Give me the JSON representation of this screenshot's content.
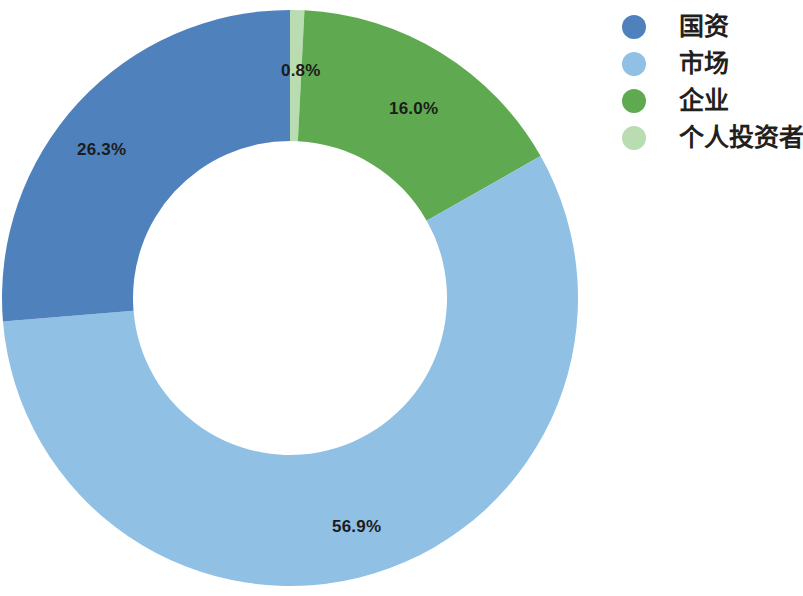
{
  "chart_data": {
    "type": "pie",
    "variant": "donut",
    "title": "",
    "subtitle": "",
    "xlabel": "",
    "ylabel": "",
    "grid": false,
    "legend_position": "right",
    "value_unit": "%",
    "start_angle_deg": 0,
    "direction": "clockwise",
    "categories": [
      "个人投资者",
      "企业",
      "市场",
      "国资"
    ],
    "values": [
      0.8,
      16.0,
      56.9,
      26.3
    ],
    "labels": [
      "0.8%",
      "16.0%",
      "56.9%",
      "26.3%"
    ],
    "colors": [
      "#b9ddb0",
      "#5faa50",
      "#90c0e4",
      "#4f82bd"
    ],
    "slices": [
      {
        "name": "个人投资者",
        "value": 0.8,
        "label": "0.8%",
        "color": "#b9ddb0"
      },
      {
        "name": "企业",
        "value": 16.0,
        "label": "16.0%",
        "color": "#5faa50"
      },
      {
        "name": "市场",
        "value": 56.9,
        "label": "56.9%",
        "color": "#90c0e4"
      },
      {
        "name": "国资",
        "value": 26.3,
        "label": "26.3%",
        "color": "#4f82bd"
      }
    ]
  },
  "legend": {
    "items": [
      {
        "label": "国资",
        "color": "#4f82bd"
      },
      {
        "label": "市场",
        "color": "#90c0e4"
      },
      {
        "label": "企业",
        "color": "#5faa50"
      },
      {
        "label": "个人投资者",
        "color": "#b9ddb0"
      }
    ]
  },
  "colors": {
    "state_blue": "#4f82bd",
    "market_light_blue": "#90c0e4",
    "enterprise_green": "#5faa50",
    "personal_light_green": "#b9ddb0",
    "label_text": "#1c1c1c",
    "legend_text": "#231f20",
    "background": "#ffffff"
  }
}
